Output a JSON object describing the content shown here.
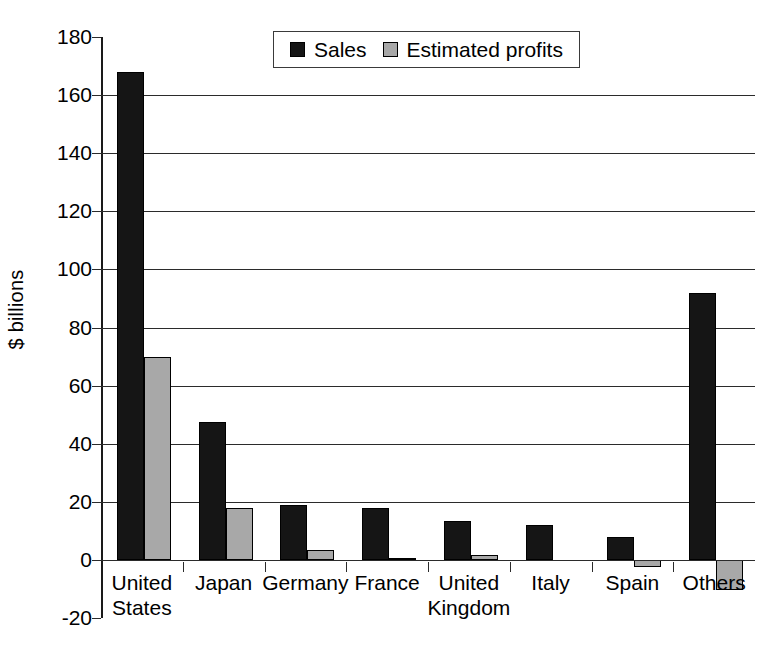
{
  "chart_data": {
    "type": "bar",
    "title": "",
    "xlabel": "",
    "ylabel": "$ billions",
    "ylim": [
      -20,
      180
    ],
    "ytick_step": 20,
    "yticks": [
      180,
      160,
      140,
      120,
      100,
      80,
      60,
      40,
      20,
      0,
      -20
    ],
    "ytick_labels": [
      "180",
      "160",
      "140",
      "120",
      "100",
      "80",
      "60",
      "40",
      "20",
      "0",
      "-20"
    ],
    "grid": "horizontal",
    "legend_position": "top-center",
    "categories": [
      "United\nStates",
      "Japan",
      "Germany",
      "France",
      "United\nKingdom",
      "Italy",
      "Spain",
      "Others"
    ],
    "series": [
      {
        "name": "Sales",
        "color": "#151515",
        "values": [
          168,
          47.5,
          19,
          18,
          13.5,
          12,
          8,
          92
        ]
      },
      {
        "name": "Estimated profits",
        "color": "#a8a8a8",
        "values": [
          70,
          18,
          3.5,
          0.7,
          1.8,
          0,
          -2.5,
          -10.5
        ]
      }
    ]
  },
  "legend": {
    "items": [
      {
        "label": "Sales",
        "swatch": "sales"
      },
      {
        "label": "Estimated profits",
        "swatch": "profits"
      }
    ]
  }
}
